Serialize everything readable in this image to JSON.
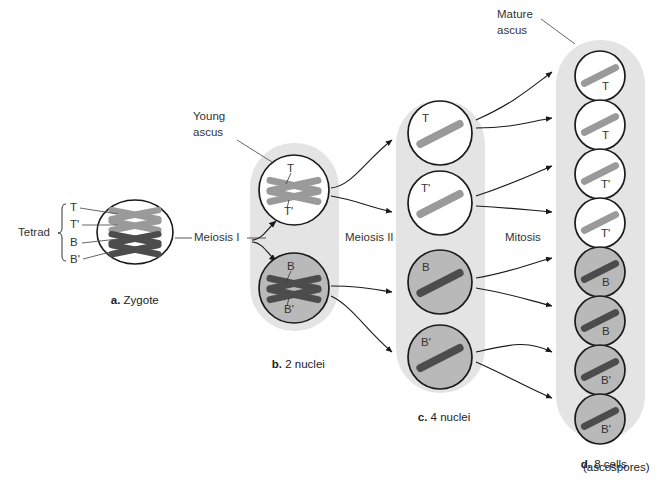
{
  "figure": {
    "background": "#ffffff"
  },
  "colors": {
    "light_chromosome": "#9a9a9a",
    "dark_chromosome": "#4c4c4c",
    "capsule_fill": "#e4e4e4",
    "white_cell": "#ffffff",
    "gray_cell": "#b9b9b9",
    "outline": "#1a1a1a",
    "leader": "#555555"
  },
  "annotations": {
    "tetrad": "Tetrad",
    "young_ascus_line1": "Young",
    "young_ascus_line2": "ascus",
    "mature_ascus_line1": "Mature",
    "mature_ascus_line2": "ascus",
    "meiosis_1": "Meiosis I",
    "meiosis_2": "Meiosis II",
    "mitosis": "Mitosis"
  },
  "tetrad_labels": [
    "T",
    "T'",
    "B",
    "B'"
  ],
  "stages": [
    {
      "key": "zygote",
      "caption_letter": "a.",
      "caption_text": " Zygote",
      "cells": [
        {
          "label_top": "T",
          "label_bottom": "T'",
          "shade": "white",
          "chromosomes": "two-light-crossed"
        },
        {
          "label_top": "B",
          "label_bottom": "B'",
          "shade": "white",
          "chromosomes": "two-dark-crossed"
        }
      ]
    },
    {
      "key": "two_nuclei",
      "caption_letter": "b.",
      "caption_text": " 2 nuclei",
      "cells": [
        {
          "label_top": "T",
          "label_bottom": "T'",
          "shade": "white",
          "tone": "light"
        },
        {
          "label_top": "B",
          "label_bottom": "B'",
          "shade": "gray",
          "tone": "dark"
        }
      ]
    },
    {
      "key": "four_nuclei",
      "caption_letter": "c.",
      "caption_text": " 4 nuclei",
      "cells": [
        {
          "label": "T",
          "shade": "white",
          "tone": "light"
        },
        {
          "label": "T'",
          "shade": "white",
          "tone": "light"
        },
        {
          "label": "B",
          "shade": "gray",
          "tone": "dark"
        },
        {
          "label": "B'",
          "shade": "gray",
          "tone": "dark"
        }
      ]
    },
    {
      "key": "eight_cells",
      "caption_letter": "d.",
      "caption_line1": " 8 cells",
      "caption_line2": "(ascospores)",
      "cells": [
        {
          "label": "T",
          "shade": "white",
          "tone": "light"
        },
        {
          "label": "T",
          "shade": "white",
          "tone": "light"
        },
        {
          "label": "T'",
          "shade": "white",
          "tone": "light"
        },
        {
          "label": "T'",
          "shade": "white",
          "tone": "light"
        },
        {
          "label": "B",
          "shade": "gray",
          "tone": "dark"
        },
        {
          "label": "B",
          "shade": "gray",
          "tone": "dark"
        },
        {
          "label": "B'",
          "shade": "gray",
          "tone": "dark"
        },
        {
          "label": "B'",
          "shade": "gray",
          "tone": "dark"
        }
      ]
    }
  ]
}
